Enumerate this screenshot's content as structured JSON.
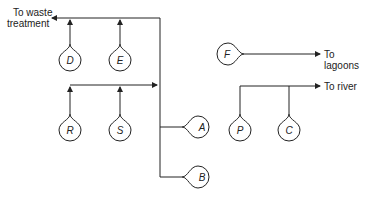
{
  "labels": {
    "waste_line1": "To waste",
    "waste_line2": "treatment",
    "lagoons": "To lagoons",
    "river": "To river"
  },
  "nodes": {
    "D": "D",
    "E": "E",
    "R": "R",
    "S": "S",
    "A": "A",
    "B": "B",
    "F": "F",
    "P": "P",
    "C": "C"
  },
  "colors": {
    "line": "#222222",
    "background": "#ffffff"
  }
}
